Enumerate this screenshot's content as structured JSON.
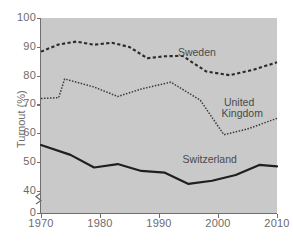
{
  "figure": {
    "background_color": "#ffffff",
    "plot_background_color": "#c9c9c9",
    "axis_color": "#6e6e6e",
    "label_color": "#6b6b6b",
    "series_label_color": "#4a4a4a",
    "faint_top_text": ""
  },
  "axes": {
    "y_title": "Turnout (%)",
    "x_title": "",
    "y_ticks": [
      "0",
      "40",
      "50",
      "60",
      "70",
      "80",
      "90",
      "100"
    ],
    "x_ticks": [
      "1970",
      "1980",
      "1990",
      "2000",
      "2010"
    ],
    "y_axis_break": true,
    "ylim": [
      40,
      100
    ],
    "xlim": [
      1970,
      2010
    ],
    "grid": false
  },
  "legend": {
    "position": "inline-annotations",
    "entries": [
      {
        "name": "Sweden",
        "style": "dashed-thick"
      },
      {
        "name": "United Kingdom",
        "style": "dotted-thin",
        "label_line_1": "United",
        "label_line_2": "Kingdom"
      },
      {
        "name": "Switzerland",
        "style": "solid-thick"
      }
    ]
  },
  "annotations": [
    {
      "text": "Sweden",
      "x": 1993.2,
      "y": 88.0
    },
    {
      "text": "United",
      "x": 2001.0,
      "y": 70.3
    },
    {
      "text": "Kingdom",
      "x": 2000.6,
      "y": 66.8
    },
    {
      "text": "Switzerland",
      "x": 1994.0,
      "y": 50.5
    }
  ],
  "chart_data": {
    "type": "line",
    "title": "",
    "subtitle": "",
    "xlabel": "",
    "ylabel": "Turnout (%)",
    "xlim": [
      1970,
      2010
    ],
    "ylim": [
      40,
      100
    ],
    "y_axis_break_below": 40,
    "grid": false,
    "legend_position": "inline-annotations",
    "series": [
      {
        "name": "Sweden",
        "style": "dashed",
        "color": "#2b2b2b",
        "points": [
          {
            "x": 1970,
            "y": 88.3
          },
          {
            "x": 1973,
            "y": 90.8
          },
          {
            "x": 1976,
            "y": 91.8
          },
          {
            "x": 1979,
            "y": 90.7
          },
          {
            "x": 1982,
            "y": 91.4
          },
          {
            "x": 1985,
            "y": 89.9
          },
          {
            "x": 1988,
            "y": 86.0
          },
          {
            "x": 1991,
            "y": 86.7
          },
          {
            "x": 1994,
            "y": 86.8
          },
          {
            "x": 1998,
            "y": 81.4
          },
          {
            "x": 2002,
            "y": 80.1
          },
          {
            "x": 2006,
            "y": 82.0
          },
          {
            "x": 2010,
            "y": 84.6
          }
        ]
      },
      {
        "name": "United Kingdom",
        "style": "dotted",
        "color": "#3a3a3a",
        "points": [
          {
            "x": 1970,
            "y": 72.0
          },
          {
            "x": 1973,
            "y": 72.3
          },
          {
            "x": 1974,
            "y": 78.8
          },
          {
            "x": 1979,
            "y": 76.0
          },
          {
            "x": 1983,
            "y": 72.7
          },
          {
            "x": 1987,
            "y": 75.3
          },
          {
            "x": 1992,
            "y": 77.7
          },
          {
            "x": 1997,
            "y": 71.4
          },
          {
            "x": 2001,
            "y": 59.4
          },
          {
            "x": 2005,
            "y": 61.4
          },
          {
            "x": 2010,
            "y": 65.1
          }
        ]
      },
      {
        "name": "Switzerland",
        "style": "solid",
        "color": "#1f1f1f",
        "points": [
          {
            "x": 1970,
            "y": 55.8
          },
          {
            "x": 1975,
            "y": 52.4
          },
          {
            "x": 1979,
            "y": 48.0
          },
          {
            "x": 1983,
            "y": 49.2
          },
          {
            "x": 1987,
            "y": 46.8
          },
          {
            "x": 1991,
            "y": 46.2
          },
          {
            "x": 1995,
            "y": 42.3
          },
          {
            "x": 1999,
            "y": 43.4
          },
          {
            "x": 2003,
            "y": 45.4
          },
          {
            "x": 2007,
            "y": 48.9
          },
          {
            "x": 2010,
            "y": 48.4
          }
        ]
      }
    ]
  }
}
